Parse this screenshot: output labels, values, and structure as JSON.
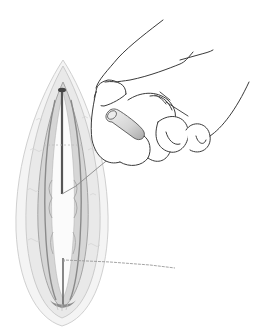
{
  "figure": {
    "elements": [
      {
        "name": "incision",
        "description": "elongated vertical incision, pointed top, rounded bottom"
      },
      {
        "name": "hand",
        "description": "hand at upper right holding a small cylindrical capsule"
      },
      {
        "name": "capsule",
        "description": "small cylindrical implant held between fingers"
      },
      {
        "name": "suture-line-upper",
        "description": "diagonal thread from incision toward fingers"
      },
      {
        "name": "suture-line-lower",
        "description": "thread extending right from lower incision"
      }
    ],
    "colors": {
      "background": "#ffffff",
      "line": "#3a3a3a",
      "tissue_light": "#e4e4e4",
      "tissue_mid": "#bdbdbd",
      "tissue_dark": "#6e6e6e",
      "suture": "#9a9a9a"
    }
  }
}
